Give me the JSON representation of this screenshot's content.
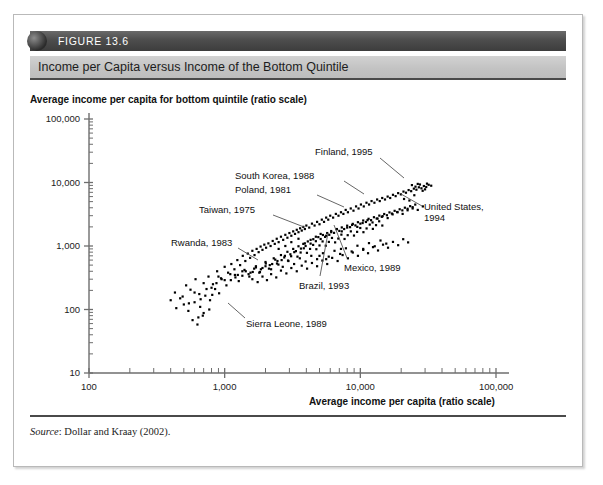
{
  "figure": {
    "number": "FIGURE 13.6",
    "title": "Income per Capita versus Income of the Bottom Quintile",
    "source_prefix": "Source",
    "source_text": ": Dollar and Kraay (2002)."
  },
  "chart_data": {
    "type": "scatter",
    "title": "Income per Capita versus Income of the Bottom Quintile",
    "xlabel": "Average income per capita (ratio scale)",
    "ylabel": "Average income per capita for bottom quintile (ratio scale)",
    "xscale": "log",
    "yscale": "log",
    "xlim": [
      100,
      100000
    ],
    "ylim": [
      10,
      100000
    ],
    "grid": false,
    "legend": null,
    "xticks": [
      "100",
      "1,000",
      "10,000",
      "100,000"
    ],
    "xtick_values": [
      100,
      1000,
      10000,
      100000
    ],
    "yticks": [
      "10",
      "100",
      "1,000",
      "10,000",
      "100,000"
    ],
    "ytick_values": [
      10,
      100,
      1000,
      10000,
      100000
    ],
    "marker": "small black square",
    "annotations": [
      {
        "label": "Finland, 1995",
        "x": 20000,
        "y": 9000
      },
      {
        "label": "South Korea, 1988",
        "x": 7500,
        "y": 3700
      },
      {
        "label": "Poland, 1981",
        "x": 5200,
        "y": 2700
      },
      {
        "label": "Taiwan, 1975",
        "x": 3300,
        "y": 1500
      },
      {
        "label": "Rwanda, 1983",
        "x": 900,
        "y": 330
      },
      {
        "label": "United States, 1994",
        "x": 26000,
        "y": 7000
      },
      {
        "label": "Mexico, 1989",
        "x": 7200,
        "y": 900
      },
      {
        "label": "Brazil, 1993",
        "x": 5600,
        "y": 620
      },
      {
        "label": "Sierra Leone, 1989",
        "x": 700,
        "y": 95
      }
    ],
    "points": [
      [
        430,
        185
      ],
      [
        470,
        150
      ],
      [
        520,
        240
      ],
      [
        560,
        205
      ],
      [
        610,
        300
      ],
      [
        650,
        175
      ],
      [
        700,
        260
      ],
      [
        760,
        330
      ],
      [
        820,
        250
      ],
      [
        880,
        400
      ],
      [
        940,
        310
      ],
      [
        1000,
        470
      ],
      [
        1060,
        380
      ],
      [
        1120,
        520
      ],
      [
        1180,
        430
      ],
      [
        500,
        120
      ],
      [
        540,
        95
      ],
      [
        600,
        130
      ],
      [
        660,
        110
      ],
      [
        720,
        165
      ],
      [
        780,
        140
      ],
      [
        850,
        210
      ],
      [
        910,
        180
      ],
      [
        1240,
        600
      ],
      [
        1300,
        500
      ],
      [
        1360,
        700
      ],
      [
        1420,
        580
      ],
      [
        1480,
        760
      ],
      [
        1540,
        650
      ],
      [
        1600,
        840
      ],
      [
        1660,
        720
      ],
      [
        1720,
        900
      ],
      [
        1780,
        800
      ],
      [
        1840,
        980
      ],
      [
        1900,
        870
      ],
      [
        1960,
        1050
      ],
      [
        2020,
        940
      ],
      [
        2100,
        1100
      ],
      [
        2180,
        1000
      ],
      [
        2260,
        1200
      ],
      [
        2340,
        1080
      ],
      [
        2420,
        1300
      ],
      [
        2500,
        1150
      ],
      [
        2600,
        1400
      ],
      [
        2700,
        1250
      ],
      [
        2800,
        1500
      ],
      [
        2900,
        1350
      ],
      [
        3000,
        1600
      ],
      [
        3100,
        1450
      ],
      [
        3200,
        1700
      ],
      [
        3300,
        1550
      ],
      [
        3400,
        1800
      ],
      [
        3500,
        1650
      ],
      [
        3600,
        1900
      ],
      [
        3700,
        1750
      ],
      [
        3800,
        2000
      ],
      [
        3900,
        1850
      ],
      [
        4000,
        2100
      ],
      [
        4200,
        1950
      ],
      [
        4400,
        2250
      ],
      [
        4600,
        2100
      ],
      [
        4800,
        2400
      ],
      [
        5000,
        2200
      ],
      [
        5200,
        2600
      ],
      [
        5400,
        2400
      ],
      [
        5600,
        2800
      ],
      [
        5800,
        2600
      ],
      [
        6000,
        3000
      ],
      [
        6300,
        2800
      ],
      [
        6600,
        3200
      ],
      [
        6900,
        3000
      ],
      [
        7200,
        3400
      ],
      [
        7500,
        3200
      ],
      [
        7800,
        3700
      ],
      [
        8100,
        3400
      ],
      [
        8500,
        3900
      ],
      [
        8900,
        3600
      ],
      [
        9300,
        4200
      ],
      [
        9700,
        3900
      ],
      [
        10100,
        4500
      ],
      [
        10600,
        4200
      ],
      [
        11100,
        4800
      ],
      [
        11600,
        4500
      ],
      [
        12100,
        5100
      ],
      [
        12700,
        4800
      ],
      [
        13300,
        5400
      ],
      [
        13900,
        5100
      ],
      [
        14500,
        5700
      ],
      [
        15200,
        5400
      ],
      [
        15900,
        6000
      ],
      [
        16600,
        5700
      ],
      [
        17400,
        6400
      ],
      [
        18200,
        6100
      ],
      [
        19000,
        6800
      ],
      [
        19900,
        6500
      ],
      [
        20800,
        7200
      ],
      [
        21700,
        6900
      ],
      [
        22700,
        7600
      ],
      [
        23700,
        7300
      ],
      [
        24800,
        8000
      ],
      [
        25900,
        7700
      ],
      [
        27000,
        8400
      ],
      [
        28200,
        8100
      ],
      [
        29400,
        8800
      ],
      [
        30600,
        8500
      ],
      [
        31900,
        9200
      ],
      [
        33300,
        8900
      ],
      [
        25000,
        6300
      ],
      [
        26500,
        9500
      ],
      [
        1250,
        350
      ],
      [
        1400,
        420
      ],
      [
        1550,
        380
      ],
      [
        1700,
        480
      ],
      [
        1850,
        430
      ],
      [
        2000,
        560
      ],
      [
        2150,
        500
      ],
      [
        2300,
        640
      ],
      [
        2450,
        580
      ],
      [
        2600,
        720
      ],
      [
        2750,
        660
      ],
      [
        2900,
        810
      ],
      [
        3050,
        740
      ],
      [
        3200,
        900
      ],
      [
        3350,
        830
      ],
      [
        3500,
        990
      ],
      [
        3650,
        910
      ],
      [
        3800,
        1080
      ],
      [
        3950,
        1000
      ],
      [
        4100,
        1180
      ],
      [
        4300,
        1090
      ],
      [
        4500,
        1280
      ],
      [
        4700,
        1190
      ],
      [
        4900,
        1380
      ],
      [
        5100,
        1290
      ],
      [
        5300,
        1490
      ],
      [
        5500,
        1390
      ],
      [
        5700,
        1600
      ],
      [
        5900,
        1500
      ],
      [
        6100,
        1720
      ],
      [
        6400,
        1610
      ],
      [
        6700,
        1840
      ],
      [
        7000,
        1730
      ],
      [
        7300,
        1960
      ],
      [
        7600,
        1850
      ],
      [
        8000,
        2090
      ],
      [
        8400,
        1980
      ],
      [
        8800,
        2230
      ],
      [
        9200,
        2110
      ],
      [
        9600,
        2370
      ],
      [
        10000,
        2250
      ],
      [
        10500,
        2520
      ],
      [
        11000,
        2390
      ],
      [
        11500,
        2680
      ],
      [
        12000,
        2550
      ],
      [
        12600,
        2840
      ],
      [
        13200,
        2710
      ],
      [
        13800,
        3010
      ],
      [
        14400,
        2880
      ],
      [
        15000,
        3190
      ],
      [
        15700,
        3050
      ],
      [
        16400,
        3380
      ],
      [
        17100,
        3240
      ],
      [
        17900,
        3580
      ],
      [
        18700,
        3430
      ],
      [
        19500,
        3790
      ],
      [
        20400,
        3640
      ],
      [
        21300,
        4010
      ],
      [
        22300,
        3860
      ],
      [
        23300,
        4240
      ],
      [
        24300,
        4090
      ],
      [
        25400,
        4490
      ],
      [
        800,
        220
      ],
      [
        870,
        260
      ],
      [
        950,
        300
      ],
      [
        1030,
        240
      ],
      [
        1110,
        290
      ],
      [
        1190,
        350
      ],
      [
        1270,
        280
      ],
      [
        1350,
        340
      ],
      [
        1430,
        400
      ],
      [
        1520,
        330
      ],
      [
        1610,
        390
      ],
      [
        1700,
        460
      ],
      [
        1800,
        380
      ],
      [
        1900,
        450
      ],
      [
        2010,
        530
      ],
      [
        2120,
        440
      ],
      [
        2240,
        520
      ],
      [
        2360,
        610
      ],
      [
        2490,
        510
      ],
      [
        2630,
        600
      ],
      [
        2780,
        700
      ],
      [
        2930,
        590
      ],
      [
        3090,
        690
      ],
      [
        3260,
        800
      ],
      [
        3440,
        680
      ],
      [
        3630,
        790
      ],
      [
        3830,
        920
      ],
      [
        4040,
        780
      ],
      [
        4260,
        900
      ],
      [
        4490,
        1040
      ],
      [
        4740,
        890
      ],
      [
        5000,
        1020
      ],
      [
        5270,
        1180
      ],
      [
        5560,
        1010
      ],
      [
        5860,
        1160
      ],
      [
        6180,
        1340
      ],
      [
        6520,
        1140
      ],
      [
        6880,
        1310
      ],
      [
        7250,
        1510
      ],
      [
        7650,
        1290
      ],
      [
        8070,
        1480
      ],
      [
        8510,
        1700
      ],
      [
        8980,
        1460
      ],
      [
        9470,
        1670
      ],
      [
        9990,
        1920
      ],
      [
        10540,
        1650
      ],
      [
        11120,
        1890
      ],
      [
        11730,
        2170
      ],
      [
        12370,
        1860
      ],
      [
        13050,
        2130
      ],
      [
        13770,
        2450
      ],
      [
        14520,
        2100
      ],
      [
        400,
        140
      ],
      [
        440,
        105
      ],
      [
        490,
        160
      ],
      [
        545,
        125
      ],
      [
        600,
        185
      ],
      [
        665,
        145
      ],
      [
        735,
        210
      ],
      [
        810,
        170
      ],
      [
        640,
        75
      ],
      [
        700,
        88
      ],
      [
        770,
        100
      ],
      [
        580,
        68
      ],
      [
        630,
        58
      ],
      [
        690,
        80
      ],
      [
        1600,
        300
      ],
      [
        1750,
        270
      ],
      [
        1900,
        330
      ],
      [
        2050,
        290
      ],
      [
        2200,
        360
      ],
      [
        2400,
        320
      ],
      [
        2600,
        410
      ],
      [
        2850,
        370
      ],
      [
        3100,
        450
      ],
      [
        3400,
        400
      ],
      [
        3700,
        490
      ],
      [
        4050,
        440
      ],
      [
        4400,
        540
      ],
      [
        4800,
        480
      ],
      [
        5250,
        590
      ],
      [
        5700,
        520
      ],
      [
        6200,
        650
      ],
      [
        6800,
        580
      ],
      [
        7400,
        720
      ],
      [
        8100,
        640
      ],
      [
        8800,
        790
      ],
      [
        9600,
        700
      ],
      [
        10500,
        870
      ],
      [
        11400,
        770
      ],
      [
        12400,
        960
      ],
      [
        13500,
        850
      ],
      [
        14700,
        1050
      ],
      [
        16000,
        940
      ],
      [
        17400,
        1160
      ],
      [
        19000,
        1030
      ],
      [
        20700,
        1280
      ],
      [
        22500,
        1140
      ],
      [
        5000,
        700
      ],
      [
        5600,
        620
      ],
      [
        7200,
        900
      ],
      [
        2500,
        900
      ],
      [
        2800,
        1000
      ],
      [
        3100,
        1150
      ],
      [
        3500,
        1300
      ],
      [
        3900,
        1100
      ],
      [
        4300,
        1250
      ],
      [
        4700,
        1400
      ],
      [
        5100,
        1550
      ],
      [
        5600,
        1450
      ],
      [
        6100,
        1650
      ],
      [
        6700,
        1850
      ],
      [
        7300,
        1700
      ],
      [
        8000,
        1950
      ],
      [
        8700,
        2150
      ],
      [
        9500,
        2000
      ],
      [
        10400,
        2300
      ],
      [
        11300,
        2550
      ],
      [
        12300,
        2350
      ],
      [
        13400,
        2700
      ],
      [
        14600,
        2950
      ],
      [
        15900,
        2750
      ],
      [
        17300,
        3150
      ],
      [
        18800,
        3400
      ],
      [
        20500,
        3200
      ],
      [
        22300,
        3650
      ],
      [
        24300,
        3900
      ],
      [
        26500,
        3700
      ],
      [
        28900,
        4200
      ],
      [
        21000,
        5500
      ],
      [
        23000,
        5200
      ],
      [
        24000,
        9100
      ],
      [
        25500,
        8600
      ],
      [
        27500,
        9300
      ],
      [
        28800,
        7400
      ],
      [
        30000,
        7800
      ],
      [
        31000,
        9600
      ],
      [
        900,
        330
      ],
      [
        1000,
        290
      ],
      [
        1100,
        360
      ],
      [
        1200,
        320
      ],
      [
        1350,
        400
      ],
      [
        1500,
        360
      ],
      [
        1650,
        440
      ],
      [
        1820,
        390
      ],
      [
        2000,
        480
      ],
      [
        2200,
        430
      ],
      [
        2430,
        530
      ],
      [
        2680,
        470
      ],
      [
        2950,
        580
      ],
      [
        3250,
        520
      ],
      [
        3580,
        640
      ],
      [
        3950,
        570
      ],
      [
        4350,
        700
      ],
      [
        4800,
        620
      ],
      [
        5300,
        770
      ],
      [
        5850,
        680
      ],
      [
        6450,
        840
      ],
      [
        7100,
        750
      ],
      [
        7830,
        920
      ],
      [
        8630,
        820
      ],
      [
        9520,
        1010
      ],
      [
        10500,
        900
      ],
      [
        11580,
        1110
      ],
      [
        12770,
        990
      ],
      [
        14080,
        1220
      ],
      [
        15530,
        1090
      ]
    ]
  },
  "axis": {
    "xlabel": "Average income per capita (ratio scale)",
    "ylabel": "Average income per capita for bottom quintile (ratio scale)"
  }
}
